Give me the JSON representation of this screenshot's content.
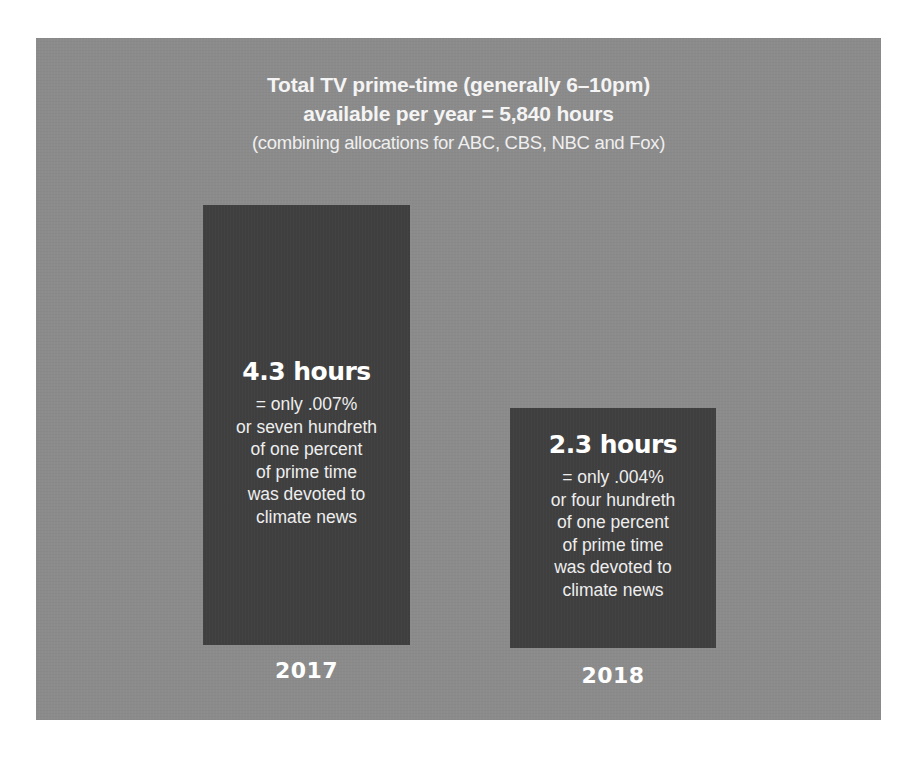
{
  "header": {
    "title_line1": "Total TV prime-time (generally 6–10pm)",
    "title_line2": "available per year = 5,840 hours",
    "subtitle": "(combining allocations for ABC, CBS, NBC and Fox)"
  },
  "bars": [
    {
      "year": "2017",
      "value_label": "4.3 hours",
      "desc_lines": [
        "= only .007%",
        "or seven hundreth",
        "of one percent",
        "of prime time",
        "was devoted to",
        "climate news"
      ]
    },
    {
      "year": "2018",
      "value_label": "2.3 hours",
      "desc_lines": [
        "= only .004%",
        "or four hundreth",
        "of one percent",
        "of prime time",
        "was devoted to",
        "climate news"
      ]
    }
  ],
  "colors": {
    "panel_background": "#8b8b8b",
    "bar_fill": "#3f3f3f",
    "text": "#ffffff"
  },
  "chart_data": {
    "type": "bar",
    "title": "Total TV prime-time (generally 6–10pm) available per year = 5,840 hours",
    "subtitle": "(combining allocations for ABC, CBS, NBC and Fox)",
    "categories": [
      "2017",
      "2018"
    ],
    "values": [
      4.3,
      2.3
    ],
    "unit": "hours",
    "percent_of_prime_time": [
      0.007,
      0.004
    ],
    "total_available_hours": 5840,
    "annotations": [
      "4.3 hours = only .007% or seven hundreth of one percent of prime time was devoted to climate news",
      "2.3 hours = only .004% or four hundreth of one percent of prime time was devoted to climate news"
    ],
    "xlabel": "",
    "ylabel": "",
    "grid": false,
    "legend": "none"
  }
}
